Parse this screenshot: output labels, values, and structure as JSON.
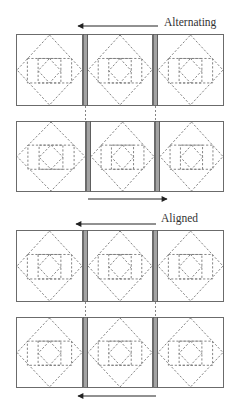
{
  "labels": {
    "alternating": "Alternating",
    "aligned": "Aligned"
  },
  "colors": {
    "outline": "#6b6b6b",
    "dash": "#777777",
    "sashing": "#a3a3a3",
    "arrow": "#222222",
    "background": "#ffffff"
  },
  "sections": [
    {
      "name": "alternating",
      "rows": [
        {
          "y": 34,
          "h": 72,
          "sashing_x": [
            83,
            153
          ]
        },
        {
          "y": 121,
          "h": 71,
          "sashing_x": [
            86,
            155
          ]
        }
      ],
      "arrows": [
        {
          "x1": 158,
          "x2": 78,
          "y": 26,
          "direction": "left"
        },
        {
          "x1": 88,
          "x2": 167,
          "y": 199,
          "direction": "right"
        }
      ]
    },
    {
      "name": "aligned",
      "rows": [
        {
          "y": 230,
          "h": 72,
          "sashing_x": [
            83,
            153
          ]
        },
        {
          "y": 317,
          "h": 71,
          "sashing_x": [
            83,
            153
          ]
        }
      ],
      "arrows": [
        {
          "x1": 156,
          "x2": 76,
          "y": 224,
          "direction": "left"
        },
        {
          "x1": 156,
          "x2": 78,
          "y": 396,
          "direction": "left"
        }
      ]
    }
  ],
  "block_columns": {
    "left": 16,
    "right": 224,
    "sashing_width": 4
  }
}
